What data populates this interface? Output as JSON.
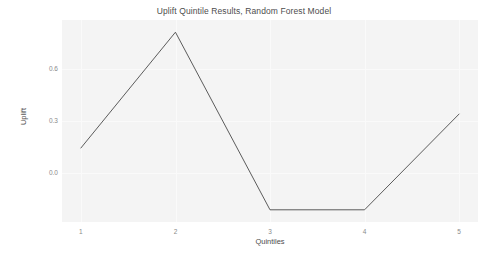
{
  "chart_data": {
    "type": "line",
    "title": "Uplift Quintile Results, Random Forest Model",
    "xlabel": "Quintiles",
    "ylabel": "Uplift",
    "categories": [
      "1",
      "2",
      "3",
      "4",
      "5"
    ],
    "x": [
      1,
      2,
      3,
      4,
      5
    ],
    "values": [
      0.145,
      0.81,
      -0.21,
      -0.21,
      0.34
    ],
    "series": [
      {
        "name": "Uplift",
        "values": [
          0.145,
          0.81,
          -0.21,
          -0.21,
          0.34
        ]
      }
    ],
    "xtick_labels": [
      "1",
      "2",
      "3",
      "4",
      "5"
    ],
    "ytick_labels": [
      "0.0",
      "0.3",
      "0.6"
    ],
    "yticks": [
      0.0,
      0.3,
      0.6
    ],
    "xlim": [
      0.8,
      5.2
    ],
    "ylim": [
      -0.28,
      0.88
    ],
    "grid": true,
    "legend": false,
    "legend_position": "none",
    "line_color": "#4a4a4a",
    "panel_background": "#f4f4f4",
    "grid_color": "#fafafa",
    "text_color": "#4d4d4d",
    "tick_color": "#8a8a8a"
  }
}
